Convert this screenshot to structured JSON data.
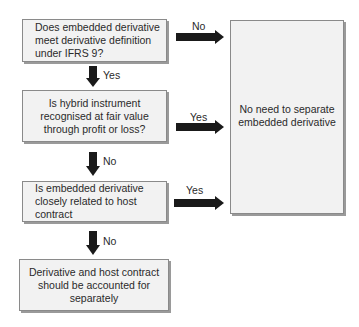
{
  "boxes": {
    "q1": "Does embedded derivative meet derivative definition under IFRS 9?",
    "q2": "Is hybrid instrument recognised at fair value through profit or loss?",
    "q3": "Is embedded derivative closely related to host contract",
    "result_separate": "Derivative and host contract should be accounted for separately",
    "result_no_separate": "No need to separate embedded derivative"
  },
  "labels": {
    "q1_right": "No",
    "q1_down": "Yes",
    "q2_right": "Yes",
    "q2_down": "No",
    "q3_right": "Yes",
    "q3_down": "No"
  },
  "colors": {
    "box_fill": "#f2f2f2",
    "box_border": "#8a8a8a",
    "arrow": "#1a1a1a"
  }
}
